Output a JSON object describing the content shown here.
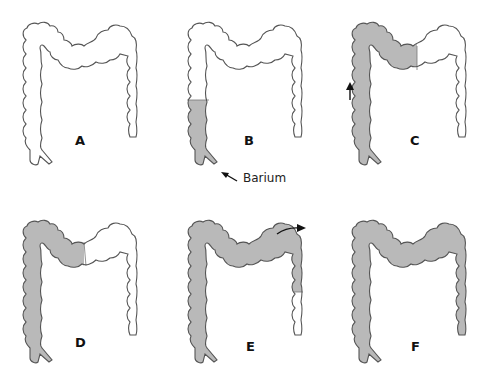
{
  "figure": {
    "colors": {
      "barium_fill": "#b9b9b9",
      "outline": "#555555",
      "empty": "#ffffff"
    },
    "panels": [
      {
        "id": "A",
        "label": "A",
        "filled_segments": []
      },
      {
        "id": "B",
        "label": "B",
        "filled_segments": [
          "rectum",
          "descending-lower"
        ],
        "annotation": "Barium",
        "annotation_icon": "arrow-pointing-to-rectum"
      },
      {
        "id": "C",
        "label": "C",
        "filled_segments": [
          "rectum",
          "descending",
          "splenic-flexure",
          "transverse-left"
        ],
        "annotation_icon": "arrow-up"
      },
      {
        "id": "D",
        "label": "D",
        "filled_segments": [
          "rectum",
          "descending",
          "splenic-flexure",
          "transverse-left-half"
        ]
      },
      {
        "id": "E",
        "label": "E",
        "filled_segments": [
          "rectum",
          "descending",
          "splenic-flexure",
          "transverse",
          "hepatic-flexure",
          "ascending-upper"
        ],
        "annotation_icon": "curved-arrow-right"
      },
      {
        "id": "F",
        "label": "F",
        "filled_segments": [
          "entire-colon"
        ]
      }
    ]
  }
}
